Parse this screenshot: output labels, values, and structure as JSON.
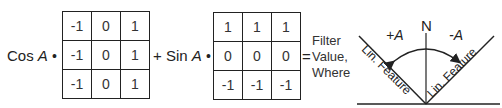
{
  "equation": {
    "term1": {
      "func": "Cos",
      "var": "A",
      "dot": "•"
    },
    "plus": "+",
    "term2": {
      "func": "Sin",
      "var": "A",
      "dot": "•"
    },
    "equals": "=",
    "result_lines": [
      "Filter",
      "Value,",
      "Where"
    ]
  },
  "kernel_cos": [
    [
      "-1",
      "0",
      "1"
    ],
    [
      "-1",
      "0",
      "1"
    ],
    [
      "-1",
      "0",
      "1"
    ]
  ],
  "kernel_sin": [
    [
      "1",
      "1",
      "1"
    ],
    [
      "0",
      "0",
      "0"
    ],
    [
      "-1",
      "-1",
      "-1"
    ]
  ],
  "angle_diagram": {
    "north_label": "N",
    "plus_angle_label": "+A",
    "minus_angle_label": "-A",
    "left_feature_label": "Lin. Feature",
    "right_feature_label": "Lin. Feature"
  }
}
